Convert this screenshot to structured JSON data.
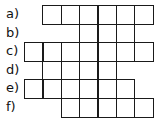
{
  "puzzle": {
    "grid": {
      "origin_x": 24,
      "origin_y": 5,
      "cell_w": 18.3,
      "cell_h": 18.5,
      "line_color": "#1a1a1a"
    },
    "rows": [
      {
        "label": "a)",
        "start_col": 1,
        "cells": 6,
        "open_tb": false
      },
      {
        "label": "b)",
        "start_col": 3,
        "cells": 3,
        "open_tb": true
      },
      {
        "label": "c)",
        "start_col": 0,
        "cells": 7,
        "open_tb": false
      },
      {
        "label": "d)",
        "start_col": 1,
        "cells": 4,
        "open_tb": true
      },
      {
        "label": "e)",
        "start_col": 0,
        "cells": 6,
        "open_tb": false
      },
      {
        "label": "f)",
        "start_col": 2,
        "cells": 5,
        "open_tb": false
      }
    ]
  }
}
